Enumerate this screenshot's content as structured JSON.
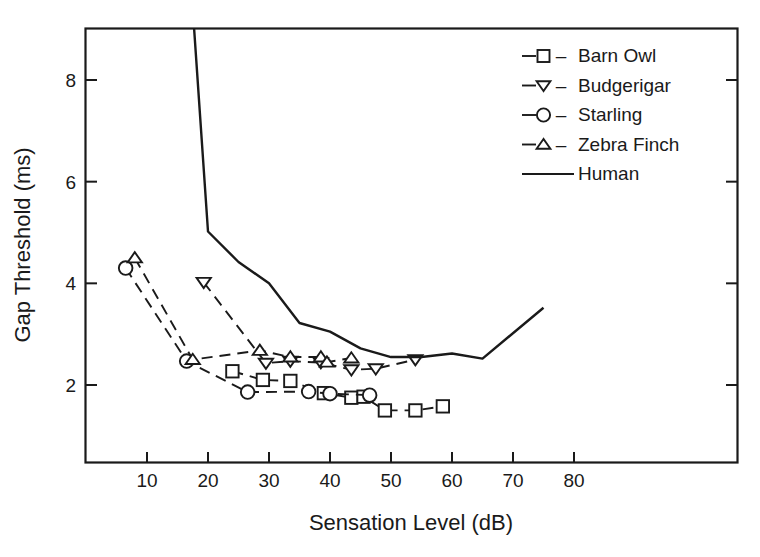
{
  "chart_data": {
    "type": "line",
    "title": "",
    "xlabel": "Sensation Level (dB)",
    "ylabel": "Gap Threshold (ms)",
    "xlim": [
      0,
      85
    ],
    "ylim": [
      1.1,
      9.4
    ],
    "xticks": [
      10,
      20,
      30,
      40,
      50,
      60,
      70,
      80
    ],
    "yticks": [
      2,
      4,
      6,
      8
    ],
    "xtick_labels": [
      "10",
      "20",
      "30",
      "40",
      "50",
      "60",
      "70",
      "80"
    ],
    "ytick_labels": [
      "2",
      "4",
      "6",
      "8"
    ],
    "grid": false,
    "legend_position": "top-right",
    "series": [
      {
        "name": "Barn Owl",
        "marker": "square",
        "linestyle": "dashed",
        "x": [
          24.0,
          29.0,
          33.5,
          39.0,
          43.5,
          45.5,
          49.0,
          54.0,
          58.5
        ],
        "y": [
          2.27,
          2.1,
          2.08,
          1.84,
          1.75,
          1.77,
          1.5,
          1.5,
          1.58
        ]
      },
      {
        "name": "Budgerigar",
        "marker": "triangle-down",
        "linestyle": "dashed",
        "x": [
          19.3,
          29.5,
          33.5,
          38.5,
          43.5,
          47.5,
          54.0
        ],
        "y": [
          4.02,
          2.43,
          2.47,
          2.44,
          2.3,
          2.32,
          2.5
        ]
      },
      {
        "name": "Starling",
        "marker": "circle",
        "linestyle": "dashed",
        "x": [
          6.5,
          16.5,
          26.5,
          36.5,
          40.0,
          46.5
        ],
        "y": [
          4.3,
          2.47,
          1.86,
          1.87,
          1.83,
          1.8
        ]
      },
      {
        "name": "Zebra Finch",
        "marker": "triangle-up",
        "linestyle": "dashed",
        "x": [
          8.0,
          17.5,
          28.5,
          33.5,
          38.5,
          39.5,
          43.5
        ],
        "y": [
          4.5,
          2.5,
          2.68,
          2.55,
          2.55,
          2.45,
          2.53
        ]
      },
      {
        "name": "Human",
        "marker": "none",
        "linestyle": "solid",
        "x": [
          17.5,
          20.0,
          25.0,
          30.0,
          35.0,
          40.0,
          45.0,
          50.0,
          55.0,
          60.0,
          65.0,
          75.0
        ],
        "y": [
          9.4,
          5.02,
          4.42,
          4.0,
          3.22,
          3.05,
          2.72,
          2.55,
          2.55,
          2.62,
          2.52,
          3.52
        ]
      }
    ]
  },
  "legend": {
    "dash_glyph": "–",
    "entries": [
      {
        "label": "Barn Owl",
        "marker": "square"
      },
      {
        "label": "Budgerigar",
        "marker": "triangle-down"
      },
      {
        "label": "Starling",
        "marker": "circle"
      },
      {
        "label": "Zebra Finch",
        "marker": "triangle-up"
      },
      {
        "label": "Human",
        "marker": "none"
      }
    ]
  }
}
